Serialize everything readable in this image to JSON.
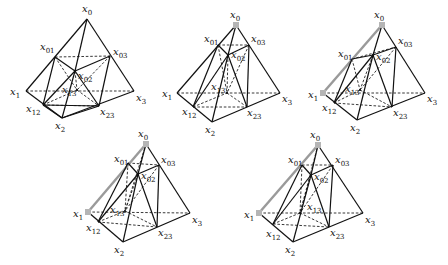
{
  "figures": [
    {
      "id": "fig1",
      "points": {
        "x0": [
          87,
          19
        ],
        "x01": [
          55,
          57
        ],
        "x03": [
          110,
          56
        ],
        "x02": [
          75,
          71
        ],
        "x13": [
          77,
          90
        ],
        "x1": [
          26,
          91
        ],
        "x3": [
          134,
          91
        ],
        "x12": [
          43,
          105
        ],
        "x23": [
          99,
          106
        ],
        "x2": [
          62,
          118
        ]
      },
      "solid": [
        [
          "x0",
          "x1"
        ],
        [
          "x0",
          "x3"
        ],
        [
          "x1",
          "x2"
        ],
        [
          "x2",
          "x3"
        ],
        [
          "x0",
          "x02"
        ],
        [
          "x01",
          "x02"
        ],
        [
          "x02",
          "x03"
        ],
        [
          "x01",
          "x12"
        ],
        [
          "x02",
          "x12"
        ],
        [
          "x02",
          "x23"
        ],
        [
          "x03",
          "x23"
        ],
        [
          "x12",
          "x2"
        ],
        [
          "x2",
          "x23"
        ],
        [
          "x12",
          "x23"
        ],
        [
          "x02",
          "x2"
        ]
      ],
      "dashed": [
        [
          "x1",
          "x3"
        ],
        [
          "x01",
          "x03"
        ],
        [
          "x01",
          "x13"
        ],
        [
          "x03",
          "x13"
        ],
        [
          "x02",
          "x13"
        ],
        [
          "x12",
          "x13"
        ],
        [
          "x13",
          "x23"
        ],
        [
          "x12",
          "x23"
        ]
      ],
      "highlight": [],
      "marks": [],
      "labels": [
        {
          "base": "x",
          "sub": "0",
          "pos": [
            82,
            12
          ]
        },
        {
          "base": "x",
          "sub": "01",
          "pos": [
            40,
            50
          ]
        },
        {
          "base": "x",
          "sub": "03",
          "pos": [
            113,
            55
          ]
        },
        {
          "base": "x",
          "sub": "02",
          "pos": [
            78,
            79
          ]
        },
        {
          "base": "x",
          "sub": "13",
          "pos": [
            62,
            93
          ]
        },
        {
          "base": "x",
          "sub": "1",
          "pos": [
            10,
            95
          ]
        },
        {
          "base": "x",
          "sub": "3",
          "pos": [
            136,
            101
          ]
        },
        {
          "base": "x",
          "sub": "12",
          "pos": [
            26,
            112
          ]
        },
        {
          "base": "x",
          "sub": "23",
          "pos": [
            100,
            115
          ]
        },
        {
          "base": "x",
          "sub": "2",
          "pos": [
            55,
            129
          ]
        }
      ]
    },
    {
      "id": "fig2",
      "points": {
        "x0": [
          236,
          25
        ],
        "x01": [
          218,
          45
        ],
        "x03": [
          249,
          45
        ],
        "x02": [
          228,
          55
        ],
        "x13": [
          227,
          93
        ],
        "x1": [
          177,
          93
        ],
        "x3": [
          280,
          93
        ],
        "x12": [
          193,
          107
        ],
        "x23": [
          247,
          107
        ],
        "x2": [
          212,
          122
        ]
      },
      "solid": [
        [
          "x0",
          "x1"
        ],
        [
          "x0",
          "x3"
        ],
        [
          "x1",
          "x2"
        ],
        [
          "x2",
          "x3"
        ],
        [
          "x0",
          "x02"
        ],
        [
          "x01",
          "x02"
        ],
        [
          "x02",
          "x03"
        ],
        [
          "x01",
          "x12"
        ],
        [
          "x02",
          "x12"
        ],
        [
          "x02",
          "x23"
        ],
        [
          "x03",
          "x23"
        ],
        [
          "x02",
          "x2"
        ]
      ],
      "dashed": [
        [
          "x1",
          "x3"
        ],
        [
          "x01",
          "x03"
        ],
        [
          "x01",
          "x13"
        ],
        [
          "x02",
          "x13"
        ],
        [
          "x12",
          "x13"
        ],
        [
          "x13",
          "x23"
        ],
        [
          "x12",
          "x23"
        ],
        [
          "x03",
          "x13"
        ]
      ],
      "highlight": [],
      "marks": [
        "x0"
      ],
      "labels": [
        {
          "base": "x",
          "sub": "0",
          "pos": [
            230,
            18
          ]
        },
        {
          "base": "x",
          "sub": "01",
          "pos": [
            204,
            42
          ]
        },
        {
          "base": "x",
          "sub": "03",
          "pos": [
            251,
            42
          ]
        },
        {
          "base": "x",
          "sub": "02",
          "pos": [
            231,
            58
          ]
        },
        {
          "base": "x",
          "sub": "13",
          "pos": [
            211,
            90
          ]
        },
        {
          "base": "x",
          "sub": "1",
          "pos": [
            162,
            97
          ]
        },
        {
          "base": "x",
          "sub": "3",
          "pos": [
            282,
            102
          ]
        },
        {
          "base": "x",
          "sub": "12",
          "pos": [
            182,
            115
          ]
        },
        {
          "base": "x",
          "sub": "23",
          "pos": [
            247,
            116
          ]
        },
        {
          "base": "x",
          "sub": "2",
          "pos": [
            205,
            133
          ]
        }
      ]
    },
    {
      "id": "fig3",
      "points": {
        "x0": [
          382,
          25
        ],
        "x01": [
          352,
          59
        ],
        "x03": [
          396,
          47
        ],
        "x02": [
          373,
          55
        ],
        "x13": [
          360,
          90
        ],
        "x1": [
          323,
          93
        ],
        "x3": [
          425,
          93
        ],
        "x12": [
          334,
          103
        ],
        "x23": [
          392,
          107
        ],
        "x2": [
          357,
          120
        ]
      },
      "solid": [
        [
          "x0",
          "x3"
        ],
        [
          "x1",
          "x2"
        ],
        [
          "x2",
          "x3"
        ],
        [
          "x0",
          "x02"
        ],
        [
          "x01",
          "x02"
        ],
        [
          "x02",
          "x03"
        ],
        [
          "x01",
          "x12"
        ],
        [
          "x02",
          "x12"
        ],
        [
          "x02",
          "x23"
        ],
        [
          "x03",
          "x23"
        ],
        [
          "x02",
          "x2"
        ]
      ],
      "dashed": [
        [
          "x1",
          "x3"
        ],
        [
          "x01",
          "x03"
        ],
        [
          "x01",
          "x13"
        ],
        [
          "x02",
          "x13"
        ],
        [
          "x12",
          "x13"
        ],
        [
          "x13",
          "x23"
        ],
        [
          "x12",
          "x23"
        ],
        [
          "x03",
          "x13"
        ]
      ],
      "highlight": [
        [
          "x0",
          "x1"
        ]
      ],
      "marks": [
        "x0",
        "x1"
      ],
      "labels": [
        {
          "base": "x",
          "sub": "0",
          "pos": [
            374,
            18
          ]
        },
        {
          "base": "x",
          "sub": "01",
          "pos": [
            338,
            57
          ]
        },
        {
          "base": "x",
          "sub": "03",
          "pos": [
            398,
            44
          ]
        },
        {
          "base": "x",
          "sub": "02",
          "pos": [
            376,
            60
          ]
        },
        {
          "base": "x",
          "sub": "13",
          "pos": [
            345,
            92
          ]
        },
        {
          "base": "x",
          "sub": "1",
          "pos": [
            308,
            98
          ]
        },
        {
          "base": "x",
          "sub": "3",
          "pos": [
            427,
            102
          ]
        },
        {
          "base": "x",
          "sub": "12",
          "pos": [
            322,
            111
          ]
        },
        {
          "base": "x",
          "sub": "23",
          "pos": [
            393,
            116
          ]
        },
        {
          "base": "x",
          "sub": "2",
          "pos": [
            350,
            131
          ]
        }
      ]
    },
    {
      "id": "fig4",
      "points": {
        "x0": [
          146,
          144
        ],
        "x01": [
          128,
          163
        ],
        "x03": [
          159,
          165
        ],
        "x02": [
          138,
          174
        ],
        "x13": [
          125,
          211
        ],
        "x1": [
          88,
          212
        ],
        "x3": [
          190,
          213
        ],
        "x12": [
          98,
          222
        ],
        "x23": [
          157,
          227
        ],
        "x2": [
          123,
          242
        ]
      },
      "solid": [
        [
          "x0",
          "x3"
        ],
        [
          "x1",
          "x2"
        ],
        [
          "x2",
          "x3"
        ],
        [
          "x0",
          "x02"
        ],
        [
          "x01",
          "x02"
        ],
        [
          "x02",
          "x03"
        ],
        [
          "x01",
          "x12"
        ],
        [
          "x02",
          "x12"
        ],
        [
          "x02",
          "x23"
        ],
        [
          "x03",
          "x23"
        ],
        [
          "x02",
          "x2"
        ]
      ],
      "dashed": [
        [
          "x1",
          "x3"
        ],
        [
          "x01",
          "x03"
        ],
        [
          "x01",
          "x13"
        ],
        [
          "x02",
          "x13"
        ],
        [
          "x12",
          "x13"
        ],
        [
          "x13",
          "x23"
        ],
        [
          "x12",
          "x23"
        ],
        [
          "x03",
          "x13"
        ],
        [
          "x0",
          "x13"
        ]
      ],
      "highlight": [
        [
          "x0",
          "x1"
        ]
      ],
      "marks": [
        "x0",
        "x1"
      ],
      "labels": [
        {
          "base": "x",
          "sub": "0",
          "pos": [
            138,
            137
          ]
        },
        {
          "base": "x",
          "sub": "01",
          "pos": [
            114,
            162
          ]
        },
        {
          "base": "x",
          "sub": "03",
          "pos": [
            161,
            163
          ]
        },
        {
          "base": "x",
          "sub": "02",
          "pos": [
            141,
            179
          ]
        },
        {
          "base": "x",
          "sub": "13",
          "pos": [
            110,
            213
          ]
        },
        {
          "base": "x",
          "sub": "1",
          "pos": [
            73,
            217
          ]
        },
        {
          "base": "x",
          "sub": "3",
          "pos": [
            192,
            223
          ]
        },
        {
          "base": "x",
          "sub": "12",
          "pos": [
            86,
            231
          ]
        },
        {
          "base": "x",
          "sub": "23",
          "pos": [
            158,
            236
          ]
        },
        {
          "base": "x",
          "sub": "2",
          "pos": [
            114,
            253
          ]
        }
      ]
    },
    {
      "id": "fig5",
      "points": {
        "x0": [
          318,
          145
        ],
        "x01": [
          302,
          165
        ],
        "x03": [
          333,
          165
        ],
        "x02": [
          311,
          175
        ],
        "x13": [
          300,
          213
        ],
        "x1": [
          259,
          213
        ],
        "x3": [
          363,
          213
        ],
        "x12": [
          273,
          224
        ],
        "x23": [
          329,
          227
        ],
        "x2": [
          293,
          242
        ]
      },
      "solid": [
        [
          "x0",
          "x3"
        ],
        [
          "x1",
          "x2"
        ],
        [
          "x2",
          "x3"
        ],
        [
          "x0",
          "x02"
        ],
        [
          "x01",
          "x02"
        ],
        [
          "x02",
          "x03"
        ],
        [
          "x01",
          "x12"
        ],
        [
          "x02",
          "x12"
        ],
        [
          "x02",
          "x23"
        ],
        [
          "x03",
          "x23"
        ],
        [
          "x02",
          "x2"
        ]
      ],
      "dashed": [
        [
          "x1",
          "x3"
        ],
        [
          "x01",
          "x03"
        ],
        [
          "x01",
          "x13"
        ],
        [
          "x02",
          "x13"
        ],
        [
          "x12",
          "x13"
        ],
        [
          "x13",
          "x23"
        ],
        [
          "x12",
          "x23"
        ],
        [
          "x03",
          "x13"
        ],
        [
          "x0",
          "x13"
        ]
      ],
      "highlight": [
        [
          "x0",
          "x1"
        ]
      ],
      "marks": [
        "x0",
        "x1"
      ],
      "labels": [
        {
          "base": "x",
          "sub": "0",
          "pos": [
            310,
            138
          ]
        },
        {
          "base": "x",
          "sub": "01",
          "pos": [
            288,
            163
          ]
        },
        {
          "base": "x",
          "sub": "03",
          "pos": [
            335,
            163
          ]
        },
        {
          "base": "x",
          "sub": "02",
          "pos": [
            314,
            180
          ]
        },
        {
          "base": "x",
          "sub": "13",
          "pos": [
            307,
            210
          ]
        },
        {
          "base": "x",
          "sub": "1",
          "pos": [
            244,
            218
          ]
        },
        {
          "base": "x",
          "sub": "3",
          "pos": [
            365,
            223
          ]
        },
        {
          "base": "x",
          "sub": "12",
          "pos": [
            266,
            237
          ]
        },
        {
          "base": "x",
          "sub": "23",
          "pos": [
            330,
            236
          ]
        },
        {
          "base": "x",
          "sub": "2",
          "pos": [
            285,
            253
          ]
        }
      ]
    }
  ]
}
